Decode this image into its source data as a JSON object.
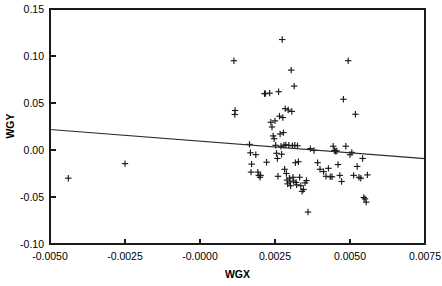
{
  "chart_data": {
    "type": "scatter",
    "title": "",
    "xlabel": "WGX",
    "ylabel": "WGY",
    "xlim": [
      -0.005,
      0.0075
    ],
    "ylim": [
      -0.1,
      0.15
    ],
    "grid": false,
    "legend": "none",
    "xticks": [
      -0.005,
      -0.0025,
      -0.0,
      0.0025,
      0.005,
      0.0075
    ],
    "xticklabels": [
      "-0.0050",
      "-0.0025",
      "-0.0000",
      "0.0025",
      "0.0050",
      "0.0075"
    ],
    "yticks": [
      -0.1,
      -0.05,
      0.0,
      0.05,
      0.1,
      0.15
    ],
    "yticklabels": [
      "-0.10",
      "-0.05",
      "0.00",
      "0.05",
      "0.10",
      "0.15"
    ],
    "marker": "plus",
    "marker_color": "#1a1a1a",
    "series": [
      {
        "name": "WGY vs WGX",
        "x": [
          -0.00439,
          -0.0025,
          0.00113,
          0.00117,
          0.00116,
          0.00165,
          0.00168,
          0.00172,
          0.0017,
          0.00186,
          0.00193,
          0.00196,
          0.002,
          0.00202,
          0.00215,
          0.00218,
          0.00222,
          0.00232,
          0.00236,
          0.0024,
          0.00244,
          0.00247,
          0.0025,
          0.00252,
          0.00255,
          0.00258,
          0.0026,
          0.00262,
          0.00265,
          0.00267,
          0.0027,
          0.00272,
          0.00274,
          0.00276,
          0.00278,
          0.0028,
          0.00282,
          0.00284,
          0.00286,
          0.00288,
          0.0029,
          0.00292,
          0.00294,
          0.00296,
          0.00298,
          0.003,
          0.00302,
          0.00304,
          0.00306,
          0.00308,
          0.0031,
          0.00312,
          0.00314,
          0.00316,
          0.00318,
          0.0032,
          0.00322,
          0.00325,
          0.00328,
          0.00332,
          0.00336,
          0.0034,
          0.00345,
          0.0035,
          0.00355,
          0.0036,
          0.00368,
          0.0038,
          0.00392,
          0.004,
          0.00412,
          0.0042,
          0.00428,
          0.00434,
          0.0044,
          0.00444,
          0.00448,
          0.00452,
          0.00456,
          0.0046,
          0.00466,
          0.00472,
          0.00478,
          0.00486,
          0.00494,
          0.005,
          0.00506,
          0.00512,
          0.00518,
          0.00524,
          0.0053,
          0.00536,
          0.00542,
          0.00546,
          0.0055,
          0.00554,
          0.00558
        ],
        "y": [
          -0.03,
          -0.0145,
          0.095,
          0.042,
          0.0378,
          0.006,
          -0.003,
          -0.015,
          -0.0235,
          -0.005,
          -0.0235,
          -0.027,
          -0.029,
          -0.027,
          0.06,
          0.06,
          -0.013,
          0.0605,
          0.0295,
          0.0245,
          0.015,
          0.012,
          0.031,
          0.005,
          -0.0035,
          -0.009,
          -0.028,
          0.062,
          0.036,
          0.017,
          0.004,
          -0.0045,
          0.1175,
          0.0345,
          0.0185,
          0.005,
          -0.0205,
          0.044,
          0.0055,
          -0.025,
          -0.032,
          -0.036,
          0.0425,
          0.005,
          -0.03,
          -0.034,
          -0.038,
          0.085,
          0.041,
          0.0045,
          -0.029,
          -0.033,
          0.068,
          0.005,
          -0.0135,
          -0.0345,
          -0.037,
          0.0045,
          -0.0125,
          -0.029,
          -0.038,
          -0.044,
          -0.042,
          -0.035,
          -0.0325,
          -0.066,
          0.0015,
          -0.0005,
          -0.0135,
          -0.0205,
          -0.023,
          -0.028,
          -0.0195,
          -0.0285,
          -0.0285,
          0.004,
          -0.0005,
          -0.0015,
          -0.001,
          -0.0155,
          -0.027,
          -0.0335,
          0.054,
          0.004,
          0.095,
          -0.005,
          -0.0025,
          -0.027,
          0.038,
          -0.0175,
          -0.029,
          -0.03,
          -0.009,
          -0.0505,
          -0.052,
          -0.0555,
          -0.0265
        ]
      }
    ],
    "fit_line": {
      "name": "least-squares fit",
      "x": [
        -0.005,
        0.0075
      ],
      "y": [
        0.0218,
        -0.0092
      ],
      "color": "#2a2a2a"
    }
  }
}
